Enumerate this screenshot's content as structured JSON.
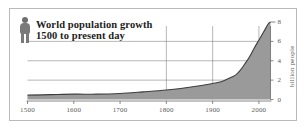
{
  "figure": {
    "legend": {
      "icon": "person-icon",
      "title_line_1": "World population growth",
      "title_line_2": "1500 to present day"
    },
    "colors": {
      "area_fill": "#9a9a9a",
      "curve_line": "#3d3d3d",
      "axis": "#6b6b6b",
      "gridline": "#6e6e6e",
      "frame": "#b9b9b9",
      "text": "#5b5b5b",
      "title_text": "#1d1d1d",
      "background": "#ffffff"
    }
  },
  "chart_data": {
    "type": "area",
    "title": "World population growth 1500 to present day",
    "xlabel": "",
    "ylabel": "billion people",
    "xlim": [
      1500,
      2025
    ],
    "ylim": [
      0,
      8
    ],
    "xticks": [
      1500,
      1600,
      1700,
      1800,
      1900,
      2000
    ],
    "xtick_labels": [
      "1500",
      "1600",
      "1700",
      "1800",
      "1900",
      "2000"
    ],
    "yticks": [
      0,
      2,
      4,
      6,
      8
    ],
    "ytick_labels": [
      "0",
      "2",
      "4",
      "6",
      "8"
    ],
    "grid": {
      "horizontal": [
        2,
        4,
        6
      ],
      "vertical": [
        1800,
        1900,
        2000
      ],
      "on": true
    },
    "legend_position": "top-left",
    "series": [
      {
        "name": "World population",
        "x": [
          1500,
          1550,
          1600,
          1650,
          1700,
          1750,
          1800,
          1850,
          1900,
          1920,
          1940,
          1950,
          1960,
          1970,
          1980,
          1990,
          2000,
          2010,
          2020,
          2025
        ],
        "values": [
          0.45,
          0.5,
          0.55,
          0.55,
          0.62,
          0.79,
          0.98,
          1.26,
          1.65,
          1.86,
          2.3,
          2.54,
          3.03,
          3.7,
          4.44,
          5.32,
          6.14,
          6.96,
          7.79,
          8.0
        ]
      }
    ]
  }
}
